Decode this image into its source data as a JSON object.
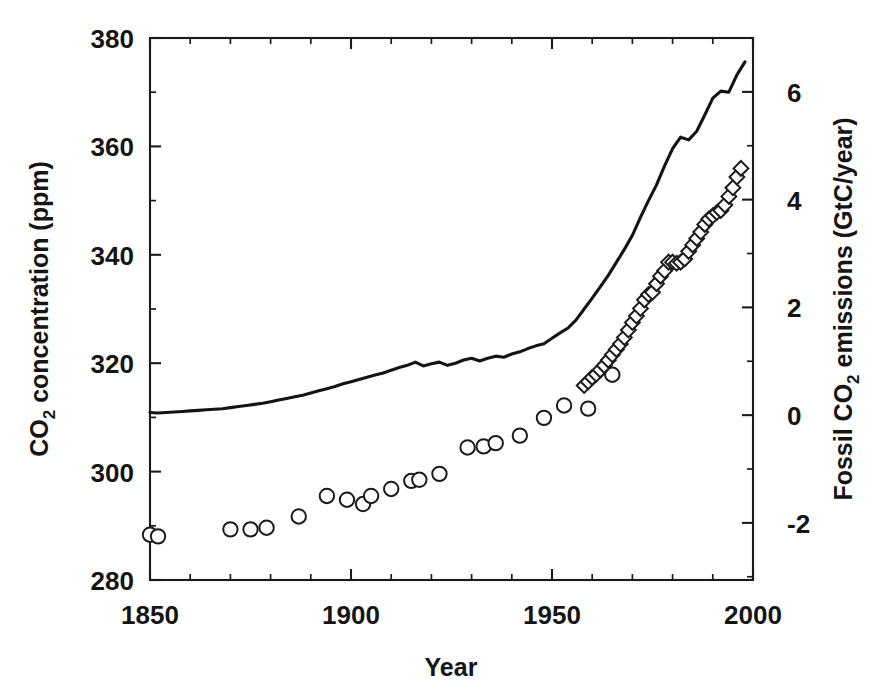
{
  "figure": {
    "background_color": "#ffffff",
    "ink_color": "#1a1a1a"
  },
  "chart_data": {
    "type": "line",
    "title": "",
    "subtitle": "",
    "xlabel": "Year",
    "ylabel": "CO2 concentration (ppm)",
    "ylabel_parts": {
      "pre": "CO",
      "sub": "2",
      "post": " concentration (ppm)"
    },
    "y2label": "Fossil CO2 emissions (GtC/year)",
    "y2label_parts": {
      "pre": "Fossil CO",
      "sub": "2",
      "post": " emissions (GtC/year)"
    },
    "xlim": [
      1850,
      2000
    ],
    "ylim": [
      280,
      380
    ],
    "y2lim": [
      -3.06,
      7.0
    ],
    "grid": false,
    "legend": "none",
    "x_ticks_major": [
      1850,
      1900,
      1950,
      2000
    ],
    "x_tick_labels": [
      "1850",
      "1900",
      "1950",
      "2000"
    ],
    "x_tick_minor_step": 10,
    "y_ticks_major": [
      280,
      300,
      320,
      340,
      360,
      380
    ],
    "y_tick_labels": [
      "280",
      "300",
      "320",
      "340",
      "360",
      "380"
    ],
    "y_tick_minor_step": 10,
    "y2_ticks_major": [
      -2,
      0,
      2,
      4,
      6
    ],
    "y2_tick_labels": [
      "-2",
      "0",
      "2",
      "4",
      "6"
    ],
    "y2_tick_minor_step": 1,
    "series": [
      {
        "name": "CO2 concentration",
        "axis": "left",
        "style": "solid-line",
        "units": "ppm",
        "x": [
          1850,
          1852,
          1854,
          1856,
          1858,
          1860,
          1862,
          1864,
          1866,
          1868,
          1870,
          1872,
          1874,
          1876,
          1878,
          1880,
          1882,
          1884,
          1886,
          1888,
          1890,
          1892,
          1894,
          1896,
          1898,
          1900,
          1902,
          1904,
          1906,
          1908,
          1910,
          1912,
          1914,
          1916,
          1918,
          1920,
          1922,
          1924,
          1926,
          1928,
          1930,
          1932,
          1934,
          1936,
          1938,
          1940,
          1942,
          1944,
          1946,
          1948,
          1950,
          1952,
          1954,
          1956,
          1958,
          1960,
          1962,
          1964,
          1966,
          1968,
          1970,
          1972,
          1974,
          1976,
          1978,
          1980,
          1982,
          1984,
          1986,
          1988,
          1990,
          1992,
          1994,
          1996,
          1998
        ],
        "y": [
          310.9,
          310.8,
          310.9,
          311.0,
          311.1,
          311.2,
          311.3,
          311.4,
          311.5,
          311.6,
          311.8,
          312.0,
          312.2,
          312.4,
          312.6,
          312.9,
          313.2,
          313.5,
          313.8,
          314.1,
          314.5,
          314.9,
          315.3,
          315.7,
          316.2,
          316.6,
          317.0,
          317.4,
          317.8,
          318.2,
          318.7,
          319.2,
          319.6,
          320.2,
          319.5,
          319.9,
          320.2,
          319.6,
          320.0,
          320.6,
          320.9,
          320.4,
          320.9,
          321.3,
          321.1,
          321.7,
          322.1,
          322.7,
          323.2,
          323.6,
          324.6,
          325.6,
          326.5,
          328.0,
          330.0,
          332.0,
          334.1,
          336.2,
          338.6,
          341.0,
          343.6,
          346.9,
          350.0,
          352.9,
          356.4,
          359.6,
          361.7,
          361.2,
          362.8,
          365.8,
          368.9,
          370.2,
          370.0,
          373.2,
          375.6
        ]
      },
      {
        "name": "Fossil CO2 emissions (early, circles)",
        "axis": "right",
        "style": "open-circle",
        "units": "GtC/year",
        "x": [
          1850,
          1852,
          1870,
          1875,
          1879,
          1887,
          1894,
          1899,
          1903,
          1905,
          1910,
          1915,
          1917,
          1922,
          1929,
          1933,
          1936,
          1942,
          1948,
          1953,
          1959,
          1965
        ],
        "y": [
          -2.22,
          -2.25,
          -2.12,
          -2.12,
          -2.09,
          -1.88,
          -1.5,
          -1.57,
          -1.65,
          -1.5,
          -1.37,
          -1.22,
          -1.2,
          -1.09,
          -0.6,
          -0.58,
          -0.52,
          -0.38,
          -0.05,
          0.18,
          0.12,
          0.75
        ]
      },
      {
        "name": "Fossil CO2 emissions (modern, diamonds)",
        "axis": "right",
        "style": "open-diamond",
        "units": "GtC/year",
        "x": [
          1958,
          1959,
          1960,
          1961,
          1962,
          1963,
          1964,
          1965,
          1966,
          1967,
          1968,
          1969,
          1970,
          1971,
          1972,
          1973,
          1974,
          1975,
          1976,
          1977,
          1978,
          1979,
          1980,
          1981,
          1982,
          1983,
          1984,
          1985,
          1986,
          1987,
          1988,
          1989,
          1990,
          1991,
          1992,
          1993,
          1994,
          1995,
          1996,
          1997
        ],
        "y": [
          0.55,
          0.62,
          0.7,
          0.76,
          0.84,
          0.92,
          1.02,
          1.12,
          1.22,
          1.32,
          1.44,
          1.58,
          1.72,
          1.84,
          1.98,
          2.14,
          2.24,
          2.28,
          2.44,
          2.58,
          2.68,
          2.84,
          2.84,
          2.82,
          2.84,
          2.9,
          3.04,
          3.16,
          3.28,
          3.4,
          3.54,
          3.64,
          3.7,
          3.76,
          3.8,
          3.9,
          4.06,
          4.22,
          4.42,
          4.58
        ]
      }
    ]
  }
}
